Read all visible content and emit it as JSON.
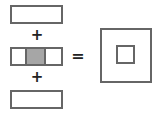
{
  "diagram": {
    "operators": {
      "plus": "+",
      "equals": "="
    },
    "colors": {
      "stroke": "#666666",
      "fill_gray": "#a6a6a6",
      "background": "#ffffff"
    },
    "left": [
      {
        "shape": "rectangle",
        "cells": 1
      },
      {
        "shape": "rectangle",
        "cells": 3,
        "shaded_cell": 2
      },
      {
        "shape": "rectangle",
        "cells": 1
      }
    ],
    "right": {
      "shape": "square-frame",
      "inner": "small-square"
    }
  }
}
